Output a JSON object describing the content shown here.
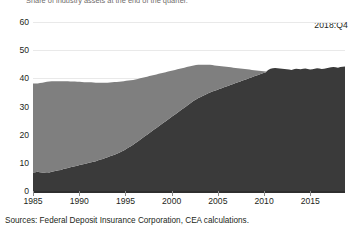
{
  "subtitle": "Share of industry assets at the end of the quarter.",
  "annotation": "2018:Q4",
  "source": "Sources: Federal Deposit Insurance Corporation, CEA calculations.",
  "colors": {
    "small_banks": "#7f7f7f",
    "large_banks": "#3a3a3a",
    "axis": "#2f2f2f",
    "grid": "#e9e9e9",
    "text": "#231f20"
  },
  "chart_data": {
    "type": "area",
    "stacked": true,
    "title": "",
    "xlabel": "",
    "ylabel": "",
    "xlim": [
      1985,
      2018.75
    ],
    "ylim": [
      0,
      60
    ],
    "ytick_labels": [
      "0",
      "10",
      "20",
      "30",
      "40",
      "50",
      "60"
    ],
    "yticks": [
      0,
      10,
      20,
      30,
      40,
      50,
      60
    ],
    "xtick_labels": [
      "1985",
      "1990",
      "1995",
      "2000",
      "2005",
      "2010",
      "2015"
    ],
    "xticks": [
      1985,
      1990,
      1995,
      2000,
      2005,
      2010,
      2015
    ],
    "grid": "horizontal",
    "legend_position": "none",
    "series": [
      {
        "name": "Small and medium banks",
        "color": "#7f7f7f",
        "order": "top",
        "values": [
          31.6,
          31.5,
          31.4,
          31.6,
          31.8,
          32.0,
          32.1,
          32.3,
          32.2,
          32.0,
          31.8,
          31.6,
          31.5,
          31.2,
          31.0,
          30.8,
          30.5,
          30.3,
          30.1,
          29.8,
          29.6,
          29.3,
          29.0,
          28.8,
          28.6,
          28.4,
          28.1,
          27.8,
          27.5,
          27.2,
          27.0,
          26.7,
          26.4,
          26.2,
          26.0,
          25.8,
          25.5,
          25.2,
          24.9,
          24.6,
          24.2,
          23.8,
          23.4,
          23.0,
          22.6,
          22.2,
          21.8,
          21.4,
          21.0,
          20.6,
          20.2,
          19.8,
          19.4,
          19.0,
          18.6,
          18.2,
          17.8,
          17.4,
          17.0,
          16.6,
          16.2,
          15.8,
          15.4,
          15.0,
          14.6,
          14.2,
          13.8,
          13.4,
          13.0,
          12.6,
          12.2,
          11.8,
          11.4,
          11.0,
          10.6,
          10.2,
          9.8,
          9.4,
          9.0,
          8.6,
          8.2,
          7.8,
          7.4,
          7.0,
          6.6,
          6.2,
          5.8,
          5.4,
          5.0,
          4.6,
          4.2,
          3.8,
          3.4,
          3.0,
          2.6,
          2.2,
          1.8,
          1.4,
          1.0,
          0.6,
          0.2,
          0.0,
          0.0,
          0.0,
          0.0,
          0.0,
          0.0,
          0.0,
          0.0,
          0.0,
          0.0,
          0.0,
          0.0,
          0.0,
          0.0,
          0.0,
          0.0,
          0.0,
          0.0,
          0.0,
          0.0,
          0.0,
          0.0,
          0.0,
          0.0,
          0.0,
          0.0,
          0.0,
          0.0,
          0.0,
          0.0,
          0.0,
          0.0,
          0.0,
          0.0
        ]
      },
      {
        "name": "Largest banks",
        "color": "#3a3a3a",
        "order": "bottom",
        "values": [
          6.6,
          6.7,
          6.8,
          6.7,
          6.6,
          6.6,
          6.7,
          6.6,
          6.8,
          7.0,
          7.2,
          7.4,
          7.5,
          7.8,
          8.0,
          8.2,
          8.4,
          8.6,
          8.8,
          9.0,
          9.2,
          9.4,
          9.6,
          9.8,
          10.0,
          10.2,
          10.4,
          10.6,
          10.9,
          11.2,
          11.4,
          11.7,
          12.0,
          12.3,
          12.6,
          12.9,
          13.2,
          13.6,
          14.0,
          14.4,
          14.9,
          15.4,
          15.9,
          16.4,
          17.0,
          17.6,
          18.2,
          18.8,
          19.4,
          20.0,
          20.6,
          21.2,
          21.8,
          22.4,
          23.0,
          23.6,
          24.2,
          24.8,
          25.4,
          26.0,
          26.6,
          27.2,
          27.8,
          28.4,
          29.0,
          29.6,
          30.2,
          30.8,
          31.4,
          32.0,
          32.5,
          33.0,
          33.4,
          33.8,
          34.2,
          34.6,
          35.0,
          35.3,
          35.6,
          35.9,
          36.2,
          36.5,
          36.8,
          37.1,
          37.4,
          37.7,
          38.0,
          38.3,
          38.6,
          38.9,
          39.2,
          39.5,
          39.8,
          40.1,
          40.4,
          40.7,
          41.0,
          41.3,
          41.6,
          41.9,
          42.2,
          43.0,
          43.4,
          43.6,
          43.7,
          43.6,
          43.5,
          43.4,
          43.3,
          43.2,
          43.1,
          43.0,
          43.2,
          43.4,
          43.3,
          43.2,
          43.4,
          43.5,
          43.3,
          43.1,
          43.2,
          43.4,
          43.6,
          43.5,
          43.3,
          43.4,
          43.6,
          43.8,
          43.9,
          44.0,
          43.9,
          43.8,
          44.0,
          44.1,
          44.2
        ]
      }
    ]
  }
}
